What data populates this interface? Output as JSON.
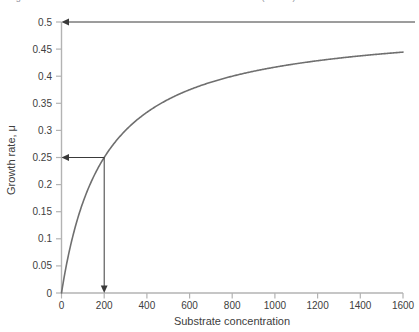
{
  "figure": {
    "caption_clipped": "Figure 1: Growth rate as a function of substrate concentration (Monod)",
    "background_color": "#ffffff"
  },
  "colors": {
    "curve": "#6f6f6f",
    "axis": "#b3b3b3",
    "annotation": "#3a3a3a",
    "text": "#404040"
  },
  "chart_data": {
    "type": "line",
    "title": "",
    "xlabel": "Substrate concentration",
    "ylabel": "Growth rate, μ",
    "xlim": [
      0,
      1600
    ],
    "ylim": [
      0,
      0.5
    ],
    "grid": false,
    "legend": "none",
    "xticks": [
      0,
      200,
      400,
      600,
      800,
      1000,
      1200,
      1400,
      1600
    ],
    "xtick_labels": [
      "0",
      "200",
      "400",
      "600",
      "800",
      "1000",
      "1200",
      "1400",
      "1600"
    ],
    "yticks": [
      0,
      0.05,
      0.1,
      0.15,
      0.2,
      0.25,
      0.3,
      0.35,
      0.4,
      0.45,
      0.5
    ],
    "ytick_labels": [
      "0",
      "0.05",
      "0.1",
      "0.15",
      "0.2",
      "0.25",
      "0.3",
      "0.35",
      "0.4",
      "0.45",
      "0.5"
    ],
    "model": "Monod: mu = mu_max * S / (Ks + S)",
    "parameters": {
      "mu_max": 0.5,
      "Ks": 200
    },
    "series": [
      {
        "name": "Growth rate",
        "x": [
          0,
          25,
          50,
          75,
          100,
          150,
          200,
          250,
          300,
          400,
          500,
          600,
          700,
          800,
          900,
          1000,
          1100,
          1200,
          1300,
          1400,
          1500,
          1600
        ],
        "values": [
          0,
          0.0556,
          0.1,
          0.1364,
          0.1667,
          0.2143,
          0.25,
          0.2778,
          0.3,
          0.3333,
          0.3571,
          0.375,
          0.3889,
          0.4,
          0.4091,
          0.4167,
          0.4231,
          0.4286,
          0.4333,
          0.4375,
          0.4412,
          0.4444
        ]
      }
    ],
    "annotations": [
      {
        "name": "mu-max-asymptote",
        "kind": "horizontal-arrow",
        "y": 0.5,
        "x_from": 1600,
        "x_to": 0,
        "arrow_at": "left",
        "label": ""
      },
      {
        "name": "half-saturation-horizontal",
        "kind": "horizontal-arrow",
        "y": 0.25,
        "x_from": 200,
        "x_to": 0,
        "arrow_at": "left",
        "label": ""
      },
      {
        "name": "half-saturation-vertical",
        "kind": "vertical-arrow",
        "x": 200,
        "y_from": 0.25,
        "y_to": 0,
        "arrow_at": "bottom",
        "label": ""
      }
    ]
  }
}
